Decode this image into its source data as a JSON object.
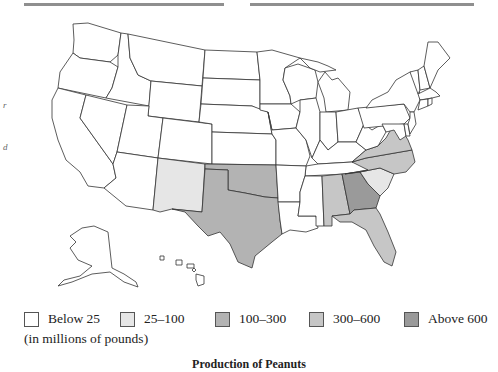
{
  "title": "Production of Peanuts",
  "units_note": "(in millions of pounds)",
  "colors": {
    "below_25": "#ffffff",
    "25_100": "#e6e6e6",
    "100_300": "#b3b3b3",
    "300_600": "#c6c6c6",
    "above_600": "#9a9a9a",
    "border": "#333333",
    "rule": "#8f8f8f"
  },
  "legend": [
    {
      "key": "below_25",
      "label": "Below 25"
    },
    {
      "key": "25_100",
      "label": "25–100"
    },
    {
      "key": "100_300",
      "label": "100–300"
    },
    {
      "key": "300_600",
      "label": "300–600"
    },
    {
      "key": "above_600",
      "label": "Above 600"
    }
  ],
  "margin_marks": [
    "r",
    "d"
  ],
  "state_categories": {
    "GA": "above_600",
    "AL": "300_600",
    "FL": "300_600",
    "VA": "300_600",
    "NC": "300_600",
    "TX": "100_300",
    "OK": "100_300",
    "NM": "25_100",
    "SC": "25_100",
    "default": "below_25"
  }
}
